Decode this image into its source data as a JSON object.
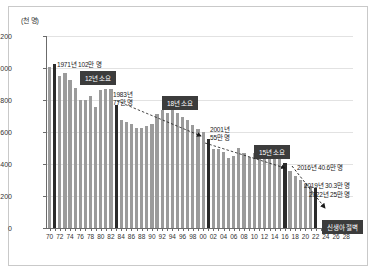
{
  "figure": {
    "unit_label": "(천 명)",
    "accent_color": "#3c3c3c",
    "bar_color": "#9b9b9b",
    "highlight_bar_color": "#2b2b2b"
  },
  "chart_data": {
    "type": "bar",
    "title": "",
    "subtitle": "",
    "xlabel": "",
    "ylabel": "(천 명)",
    "ylim": [
      0,
      1200
    ],
    "ytick_labels": [
      "0",
      "200",
      "400",
      "600",
      "800",
      "1,000",
      "1,200"
    ],
    "ytick_values": [
      0,
      200,
      400,
      600,
      800,
      1000,
      1200
    ],
    "grid": true,
    "legend": "none",
    "xtick_labels": [
      "70",
      "72",
      "74",
      "76",
      "78",
      "80",
      "82",
      "84",
      "86",
      "88",
      "90",
      "92",
      "94",
      "96",
      "98",
      "00",
      "02",
      "04",
      "06",
      "08",
      "10",
      "12",
      "14",
      "16",
      "18",
      "20",
      "22",
      "24",
      "26",
      "28"
    ],
    "categories": [
      "70",
      "71",
      "72",
      "73",
      "74",
      "75",
      "76",
      "77",
      "78",
      "79",
      "80",
      "81",
      "82",
      "83",
      "84",
      "85",
      "86",
      "87",
      "88",
      "89",
      "90",
      "91",
      "92",
      "93",
      "94",
      "95",
      "96",
      "97",
      "98",
      "99",
      "00",
      "01",
      "02",
      "03",
      "04",
      "05",
      "06",
      "07",
      "08",
      "09",
      "10",
      "11",
      "12",
      "13",
      "14",
      "15",
      "16",
      "17",
      "18",
      "19",
      "20",
      "21",
      "22"
    ],
    "values": [
      1007,
      1025,
      953,
      966,
      923,
      874,
      797,
      801,
      827,
      754,
      865,
      867,
      867,
      770,
      678,
      662,
      650,
      624,
      628,
      640,
      653,
      710,
      738,
      716,
      739,
      721,
      691,
      675,
      641,
      620,
      600,
      555,
      495,
      493,
      476,
      438,
      452,
      497,
      466,
      445,
      470,
      471,
      485,
      437,
      435,
      438,
      406,
      357,
      327,
      303,
      272,
      261,
      249
    ],
    "highlight_indices": [
      1,
      13,
      31,
      46,
      52
    ],
    "annotations": [
      {
        "text": "1971년 102만 명",
        "kind": "label"
      },
      {
        "text": "12년 소요",
        "kind": "badge"
      },
      {
        "text": "1983년\n77만 명",
        "kind": "label"
      },
      {
        "text": "18년 소요",
        "kind": "badge"
      },
      {
        "text": "2001년\n55만 명",
        "kind": "label"
      },
      {
        "text": "15년 소요",
        "kind": "badge"
      },
      {
        "text": "2016년 40.6만 명",
        "kind": "label"
      },
      {
        "text": "2019년 30.3만 명",
        "kind": "label"
      },
      {
        "text": "2022년 25만 명",
        "kind": "label"
      },
      {
        "text": "신생아 절벽",
        "kind": "badge"
      }
    ]
  },
  "annotations": {
    "a1971": "1971년 102만 명",
    "badge12": "12년 소요",
    "a1983_line1": "1983년",
    "a1983_line2": "77만 명",
    "badge18": "18년 소요",
    "a2001_line1": "2001년",
    "a2001_line2": "55만 명",
    "badge15": "15년 소요",
    "a2016": "2016년 40.6만 명",
    "a2019": "2019년 30.3만 명",
    "a2022": "2022년 25만 명",
    "badge_cliff": "신생아 절벽"
  }
}
